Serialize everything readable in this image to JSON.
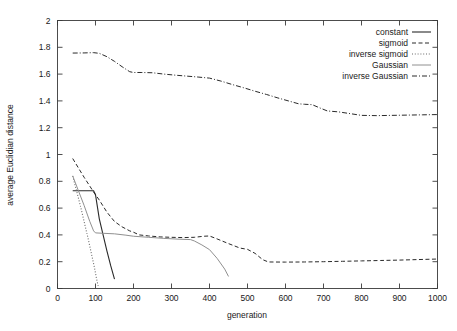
{
  "chart_data": {
    "type": "line",
    "title": "",
    "xlabel": "generation",
    "ylabel": "average Euclidian distance",
    "xlim": [
      0,
      1000
    ],
    "ylim": [
      0,
      2
    ],
    "xticks": [
      0,
      100,
      200,
      300,
      400,
      500,
      600,
      700,
      800,
      900,
      1000
    ],
    "xtick_labels": [
      "0",
      "100",
      "200",
      "300",
      "400",
      "500",
      "600",
      "700",
      "800",
      "900",
      "1000"
    ],
    "yticks": [
      0,
      0.2,
      0.4,
      0.6,
      0.8,
      1,
      1.2,
      1.4,
      1.6,
      1.8,
      2
    ],
    "ytick_labels": [
      "0",
      "0.2",
      "0.4",
      "0.6",
      "0.8",
      "1",
      "1.2",
      "1.4",
      "1.6",
      "1.8",
      "2"
    ],
    "grid": false,
    "legend_position": "top-right-inside",
    "series": [
      {
        "name": "constant",
        "style": "solid",
        "color": "#2a2a2a",
        "width": 1.1,
        "points": [
          [
            40,
            0.73
          ],
          [
            60,
            0.73
          ],
          [
            80,
            0.73
          ],
          [
            95,
            0.73
          ],
          [
            100,
            0.7
          ],
          [
            110,
            0.52
          ],
          [
            120,
            0.4
          ],
          [
            130,
            0.28
          ],
          [
            140,
            0.17
          ],
          [
            150,
            0.07
          ]
        ]
      },
      {
        "name": "sigmoid",
        "style": "dashed",
        "color": "#2a2a2a",
        "width": 1.0,
        "points": [
          [
            40,
            0.97
          ],
          [
            70,
            0.83
          ],
          [
            95,
            0.72
          ],
          [
            110,
            0.66
          ],
          [
            130,
            0.57
          ],
          [
            150,
            0.5
          ],
          [
            170,
            0.46
          ],
          [
            190,
            0.43
          ],
          [
            200,
            0.42
          ],
          [
            215,
            0.4
          ],
          [
            240,
            0.392
          ],
          [
            270,
            0.385
          ],
          [
            300,
            0.382
          ],
          [
            330,
            0.38
          ],
          [
            360,
            0.382
          ],
          [
            385,
            0.39
          ],
          [
            400,
            0.392
          ],
          [
            420,
            0.37
          ],
          [
            450,
            0.335
          ],
          [
            480,
            0.302
          ],
          [
            500,
            0.292
          ],
          [
            520,
            0.262
          ],
          [
            540,
            0.215
          ],
          [
            555,
            0.198
          ],
          [
            600,
            0.197
          ],
          [
            650,
            0.198
          ],
          [
            700,
            0.2
          ],
          [
            750,
            0.203
          ],
          [
            800,
            0.206
          ],
          [
            850,
            0.209
          ],
          [
            900,
            0.212
          ],
          [
            950,
            0.216
          ],
          [
            1000,
            0.22
          ]
        ]
      },
      {
        "name": "inverse sigmoid",
        "style": "dotted",
        "color": "#6b6b6b",
        "width": 1.1,
        "points": [
          [
            40,
            0.84
          ],
          [
            50,
            0.73
          ],
          [
            60,
            0.62
          ],
          [
            70,
            0.5
          ],
          [
            80,
            0.38
          ],
          [
            90,
            0.25
          ],
          [
            97,
            0.16
          ],
          [
            103,
            0.07
          ],
          [
            107,
            0.02
          ]
        ]
      },
      {
        "name": "Gaussian",
        "style": "solid",
        "color": "#909090",
        "width": 1.0,
        "points": [
          [
            40,
            0.84
          ],
          [
            55,
            0.73
          ],
          [
            70,
            0.62
          ],
          [
            85,
            0.5
          ],
          [
            95,
            0.43
          ],
          [
            100,
            0.415
          ],
          [
            120,
            0.412
          ],
          [
            150,
            0.408
          ],
          [
            180,
            0.398
          ],
          [
            200,
            0.39
          ],
          [
            240,
            0.382
          ],
          [
            280,
            0.374
          ],
          [
            320,
            0.368
          ],
          [
            350,
            0.365
          ],
          [
            360,
            0.355
          ],
          [
            380,
            0.325
          ],
          [
            400,
            0.29
          ],
          [
            420,
            0.225
          ],
          [
            440,
            0.145
          ],
          [
            450,
            0.09
          ]
        ]
      },
      {
        "name": "inverse Gaussian",
        "style": "dashdot",
        "color": "#2a2a2a",
        "width": 1.0,
        "points": [
          [
            40,
            1.757
          ],
          [
            70,
            1.758
          ],
          [
            95,
            1.76
          ],
          [
            110,
            1.755
          ],
          [
            130,
            1.73
          ],
          [
            150,
            1.695
          ],
          [
            170,
            1.655
          ],
          [
            190,
            1.618
          ],
          [
            200,
            1.612
          ],
          [
            220,
            1.612
          ],
          [
            250,
            1.61
          ],
          [
            280,
            1.6
          ],
          [
            310,
            1.592
          ],
          [
            340,
            1.585
          ],
          [
            370,
            1.578
          ],
          [
            400,
            1.57
          ],
          [
            430,
            1.548
          ],
          [
            460,
            1.522
          ],
          [
            490,
            1.498
          ],
          [
            520,
            1.472
          ],
          [
            550,
            1.448
          ],
          [
            580,
            1.422
          ],
          [
            610,
            1.398
          ],
          [
            635,
            1.378
          ],
          [
            650,
            1.375
          ],
          [
            670,
            1.372
          ],
          [
            690,
            1.348
          ],
          [
            710,
            1.325
          ],
          [
            740,
            1.318
          ],
          [
            770,
            1.305
          ],
          [
            800,
            1.292
          ],
          [
            840,
            1.29
          ],
          [
            880,
            1.292
          ],
          [
            920,
            1.294
          ],
          [
            960,
            1.296
          ],
          [
            1000,
            1.298
          ]
        ]
      }
    ]
  },
  "legend": {
    "entries": [
      {
        "label": "constant"
      },
      {
        "label": "sigmoid"
      },
      {
        "label": "inverse sigmoid"
      },
      {
        "label": "Gaussian"
      },
      {
        "label": "inverse Gaussian"
      }
    ]
  }
}
